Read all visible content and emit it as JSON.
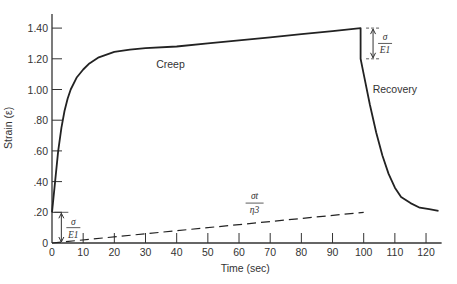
{
  "chart_data": {
    "type": "line",
    "title": "",
    "xlabel": "Time (sec)",
    "ylabel": "Strain (ε)",
    "xlim": [
      0,
      125
    ],
    "ylim": [
      0,
      1.5
    ],
    "grid": false,
    "legend": "none",
    "x_ticks": [
      "0",
      "10",
      "20",
      "30",
      "40",
      "50",
      "60",
      "70",
      "80",
      "90",
      "100",
      "110",
      "120"
    ],
    "y_ticks": [
      "0",
      ".20",
      ".40",
      ".60",
      ".80",
      "1.00",
      "1.20",
      "1.40"
    ],
    "series": [
      {
        "name": "Creep / Recovery strain",
        "style": "solid",
        "x": [
          0,
          1,
          2,
          3,
          4,
          5,
          6,
          8,
          10,
          12,
          15,
          20,
          25,
          30,
          40,
          50,
          60,
          70,
          80,
          90,
          99,
          99,
          100,
          102,
          104,
          106,
          108,
          110,
          112,
          115,
          118,
          121,
          124
        ],
        "y": [
          0.2,
          0.4,
          0.6,
          0.75,
          0.86,
          0.94,
          1.0,
          1.08,
          1.13,
          1.17,
          1.21,
          1.245,
          1.26,
          1.27,
          1.28,
          1.3,
          1.32,
          1.34,
          1.36,
          1.38,
          1.4,
          1.2,
          1.1,
          0.9,
          0.72,
          0.57,
          0.45,
          0.36,
          0.3,
          0.26,
          0.23,
          0.22,
          0.21
        ]
      },
      {
        "name": "σt/η3 (viscous flow)",
        "style": "dashed",
        "x": [
          0,
          100
        ],
        "y": [
          0.0,
          0.2
        ]
      }
    ],
    "annotations": [
      {
        "text": "Creep",
        "x": 38,
        "y": 1.14
      },
      {
        "text": "Recovery",
        "x": 110,
        "y": 0.98
      },
      {
        "text": "σt/η3",
        "x": 65,
        "y": 0.26,
        "type": "fraction",
        "numerator": "σt",
        "denominator": "η3"
      },
      {
        "text": "σ/E1",
        "x": 3,
        "y": 0.1,
        "type": "dimension",
        "numerator": "σ",
        "denominator": "E1",
        "span": [
          0,
          0.2
        ]
      },
      {
        "text": "σ/E1",
        "x": 103,
        "y": 1.3,
        "type": "dimension",
        "numerator": "σ",
        "denominator": "E1",
        "span": [
          1.2,
          1.4
        ]
      }
    ]
  }
}
